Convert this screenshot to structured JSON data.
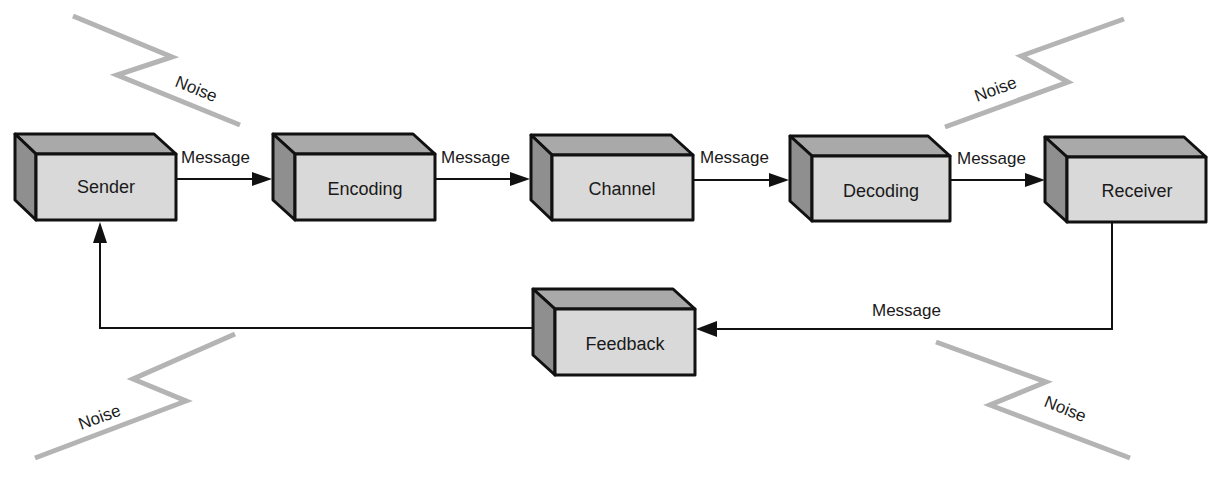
{
  "colors": {
    "front_face": "#d9d9d9",
    "top_face": "#a9a9a9",
    "side_face": "#8f8f8f",
    "outline": "#111111",
    "noise": "#b4b4b4"
  },
  "nodes": [
    {
      "id": "sender",
      "label": "Sender"
    },
    {
      "id": "encoding",
      "label": "Encoding"
    },
    {
      "id": "channel",
      "label": "Channel"
    },
    {
      "id": "decoding",
      "label": "Decoding"
    },
    {
      "id": "receiver",
      "label": "Receiver"
    },
    {
      "id": "feedback",
      "label": "Feedback"
    }
  ],
  "edges": [
    {
      "from": "sender",
      "to": "encoding",
      "label": "Message"
    },
    {
      "from": "encoding",
      "to": "channel",
      "label": "Message"
    },
    {
      "from": "channel",
      "to": "decoding",
      "label": "Message"
    },
    {
      "from": "decoding",
      "to": "receiver",
      "label": "Message"
    },
    {
      "from": "receiver",
      "to": "feedback",
      "label": "Message"
    },
    {
      "from": "feedback",
      "to": "sender",
      "label": ""
    }
  ],
  "noise": [
    {
      "id": "noise-top-left",
      "label": "Noise"
    },
    {
      "id": "noise-top-right",
      "label": "Noise"
    },
    {
      "id": "noise-bottom-left",
      "label": "Noise"
    },
    {
      "id": "noise-bottom-right",
      "label": "Noise"
    }
  ]
}
